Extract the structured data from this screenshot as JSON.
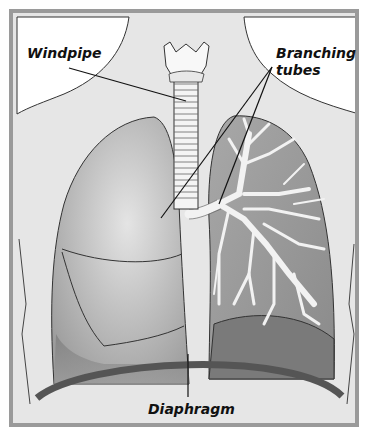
{
  "diagram": {
    "labels": {
      "windpipe": "Windpipe",
      "branching_tubes_line1": "Branching",
      "branching_tubes_line2": "tubes",
      "diaphragm": "Diaphragm"
    },
    "colors": {
      "frame": "#9a9a9a",
      "background": "#e6e6e6",
      "neck_skin": "#ffffff",
      "lung_light": "#c8c8c8",
      "lung_dark": "#8e8e8e",
      "diaphragm": "#555555",
      "outline": "#333333"
    }
  }
}
